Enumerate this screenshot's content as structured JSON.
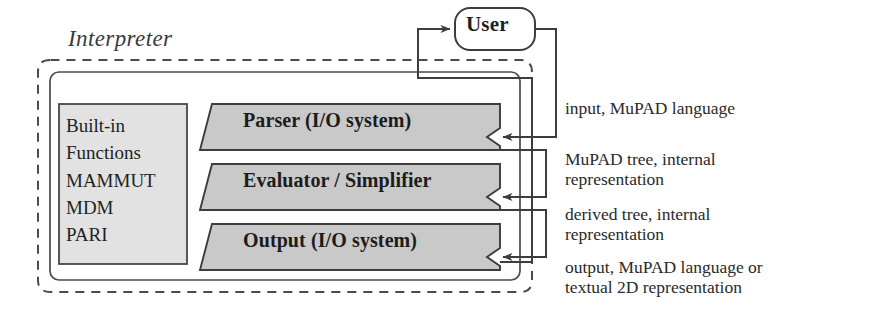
{
  "diagram": {
    "region_label": "Interpreter",
    "external_actor": {
      "name": "User",
      "shape": "rounded-rectangle"
    },
    "library_box": {
      "lines": [
        "Built-in",
        "Functions",
        "MAMMUT",
        "MDM",
        "PARI"
      ],
      "text": "Built-in\nFunctions\nMAMMUT\nMDM\nPARI"
    },
    "modules": [
      {
        "id": "parser",
        "label": "Parser (I/O system)",
        "shape": "parallelogram"
      },
      {
        "id": "evaluator",
        "label": "Evaluator / Simplifier",
        "shape": "parallelogram"
      },
      {
        "id": "output",
        "label": "Output (I/O system)",
        "shape": "parallelogram"
      }
    ],
    "annotations": [
      {
        "id": "input",
        "text": "input, MuPAD language"
      },
      {
        "id": "tree",
        "text": "MuPAD tree, internal\nrepresentation"
      },
      {
        "id": "derived",
        "text": "derived tree, internal\nrepresentation"
      },
      {
        "id": "output",
        "text": "output, MuPAD language or\ntextual 2D representation"
      }
    ],
    "colors": {
      "module_fill": "#c9c9c9",
      "library_fill": "#e2e2e2",
      "stroke": "#3d3d3d",
      "text": "#1f1f1f",
      "background": "#ffffff"
    }
  }
}
